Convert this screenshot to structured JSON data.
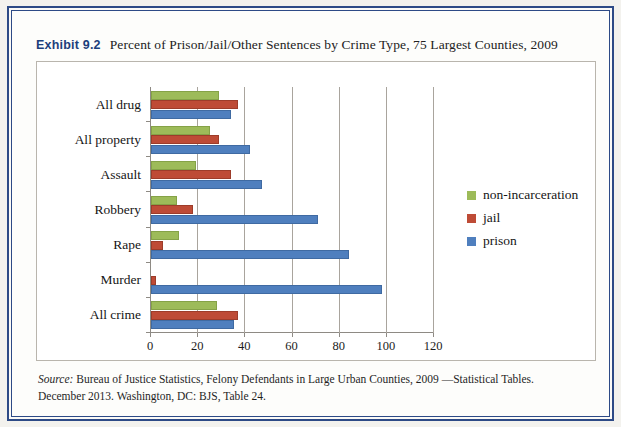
{
  "exhibit": {
    "label": "Exhibit 9.2",
    "title": "Percent of Prison/Jail/Other Sentences by Crime Type, 75 Largest Counties, 2009"
  },
  "source": {
    "prefix": "Source:",
    "text": " Bureau of Justice Statistics, Felony Defendants in Large Urban Counties, 2009 —Statistical Tables. December 2013. Washington, DC: BJS, Table 24."
  },
  "legend": {
    "items": [
      {
        "label": "non-incarceration",
        "color": "#9dbb59"
      },
      {
        "label": "jail",
        "color": "#be4b36"
      },
      {
        "label": "prison",
        "color": "#4f7fbe"
      }
    ]
  },
  "chart_data": {
    "type": "bar",
    "orientation": "horizontal",
    "title": "Percent of Prison/Jail/Other Sentences by Crime Type, 75 Largest Counties, 2009",
    "xlabel": "",
    "ylabel": "",
    "xlim": [
      0,
      120
    ],
    "xticks": [
      0,
      20,
      40,
      60,
      80,
      100,
      120
    ],
    "xtick_labels": [
      "0",
      "20",
      "40",
      "60",
      "80",
      "100",
      "120"
    ],
    "grid": true,
    "legend_position": "right",
    "categories": [
      "All drug",
      "All property",
      "Assault",
      "Robbery",
      "Rape",
      "Murder",
      "All crime"
    ],
    "series": [
      {
        "name": "non-incarceration",
        "color": "#9dbb59",
        "values": [
          29,
          25,
          19,
          11,
          12,
          0,
          28
        ]
      },
      {
        "name": "jail",
        "color": "#be4b36",
        "values": [
          37,
          29,
          34,
          18,
          5,
          2,
          37
        ]
      },
      {
        "name": "prison",
        "color": "#4f7fbe",
        "values": [
          34,
          42,
          47,
          71,
          84,
          98,
          35
        ]
      }
    ]
  }
}
